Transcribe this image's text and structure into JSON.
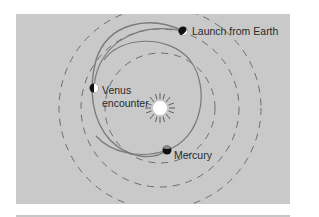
{
  "diagram": {
    "type": "orbital-trajectory",
    "background_color": "#c9c9c9",
    "line_color": "#707070",
    "sun": {
      "label": "",
      "cx": 160,
      "cy": 108
    },
    "orbits": [
      {
        "name": "mercury-orbit",
        "style": "dashed",
        "r": 55
      },
      {
        "name": "venus-orbit",
        "style": "dashed",
        "r": 79
      },
      {
        "name": "earth-orbit",
        "style": "dashed",
        "r": 101
      }
    ],
    "labels": {
      "launch": "Launch from Earth",
      "venus_line1": "Venus",
      "venus_line2": "encounter",
      "mercury": "Mercury"
    },
    "markers": [
      {
        "name": "earth",
        "cx": 183,
        "cy": 31
      },
      {
        "name": "venus",
        "cx": 94,
        "cy": 88
      },
      {
        "name": "mercury",
        "cx": 167,
        "cy": 150
      }
    ]
  }
}
